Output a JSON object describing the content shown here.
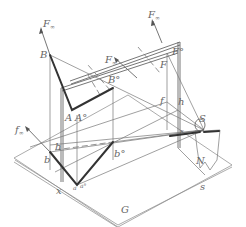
{
  "diagram": {
    "type": "perspective-projection",
    "colors": {
      "line": "#777777",
      "bold_line": "#333333",
      "label": "#666666",
      "background": "#ffffff"
    },
    "labels": {
      "F_inf_left": {
        "main": "F",
        "sub": "∞"
      },
      "F_inf_top": {
        "main": "F",
        "sub": "∞"
      },
      "F_inf_mid": {
        "main": "F",
        "sub": "∞"
      },
      "f_inf": {
        "main": "f",
        "sub": "∞"
      },
      "B": "B",
      "B_deg": "B°",
      "A": "A",
      "A_deg": "A°",
      "F_upper": "F°",
      "F_lower": "F",
      "f": "f",
      "h_right": "h",
      "h_left": "h",
      "b": "b",
      "b_deg": "b°",
      "x": "x",
      "a": "a",
      "a_deg": "a°",
      "S": "S",
      "s": "s",
      "N": "N",
      "G": "G",
      "kappa": "κ"
    }
  }
}
